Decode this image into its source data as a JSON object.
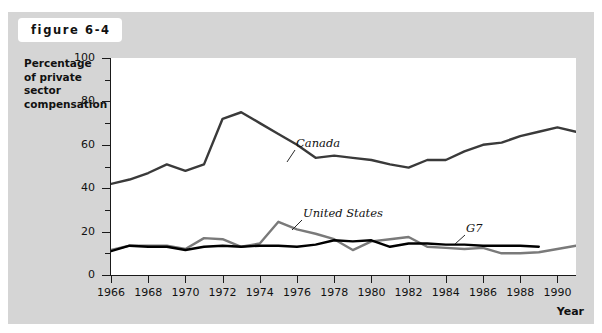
{
  "figure": {
    "badge_label": "figure 6-4"
  },
  "axis": {
    "y_title": "Percentage of private sector compensation",
    "x_title": "Year",
    "y_ticks": [
      0,
      20,
      40,
      60,
      80,
      100
    ],
    "y_minor_ticks": [
      10,
      30,
      50,
      70,
      90
    ],
    "x_ticks": [
      1966,
      1968,
      1970,
      1972,
      1974,
      1976,
      1978,
      1980,
      1982,
      1984,
      1986,
      1988,
      1990
    ]
  },
  "colors": {
    "panel": "#d5d5d5",
    "plot_bg": "#ffffff",
    "axis": "#1a1a1a",
    "canada": "#3a3a3a",
    "united_states": "#7a7a7a",
    "g7": "#000000"
  },
  "series_labels": [
    {
      "name": "Canada",
      "text": "Canada"
    },
    {
      "name": "United States",
      "text": "United States"
    },
    {
      "name": "G7",
      "text": "G7"
    }
  ],
  "chart_data": {
    "type": "line",
    "title": "figure 6-4",
    "xlabel": "Year",
    "ylabel": "Percentage of private sector compensation",
    "xlim": [
      1966,
      1991
    ],
    "ylim": [
      0,
      100
    ],
    "grid": false,
    "legend": "inline annotations",
    "x": [
      1966,
      1967,
      1968,
      1969,
      1970,
      1971,
      1972,
      1973,
      1974,
      1975,
      1976,
      1977,
      1978,
      1979,
      1980,
      1981,
      1982,
      1983,
      1984,
      1985,
      1986,
      1987,
      1988,
      1989,
      1990,
      1991
    ],
    "series": [
      {
        "name": "Canada",
        "color": "#3a3a3a",
        "values": [
          42,
          44,
          47,
          51,
          48,
          51,
          72,
          75,
          70,
          65,
          60,
          54,
          55,
          54,
          53,
          51,
          49.5,
          53,
          53,
          57,
          60,
          61,
          64,
          66,
          68,
          66
        ]
      },
      {
        "name": "United States",
        "color": "#7a7a7a",
        "values": [
          11.5,
          13.5,
          13.5,
          13.5,
          12,
          17,
          16.5,
          13,
          14.5,
          24.5,
          21,
          19,
          16.5,
          11.5,
          15.5,
          16.5,
          17.5,
          13,
          12.5,
          12,
          12.5,
          10,
          10,
          10.5,
          12,
          13.5
        ]
      },
      {
        "name": "G7",
        "color": "#000000",
        "values": [
          11,
          13.5,
          13,
          13,
          11.5,
          13,
          13.5,
          13,
          13.5,
          13.5,
          13,
          14,
          16,
          15.5,
          16,
          13,
          14.5,
          14.5,
          14,
          14,
          13.5,
          13.5,
          13.5,
          13,
          null,
          null
        ]
      }
    ]
  }
}
